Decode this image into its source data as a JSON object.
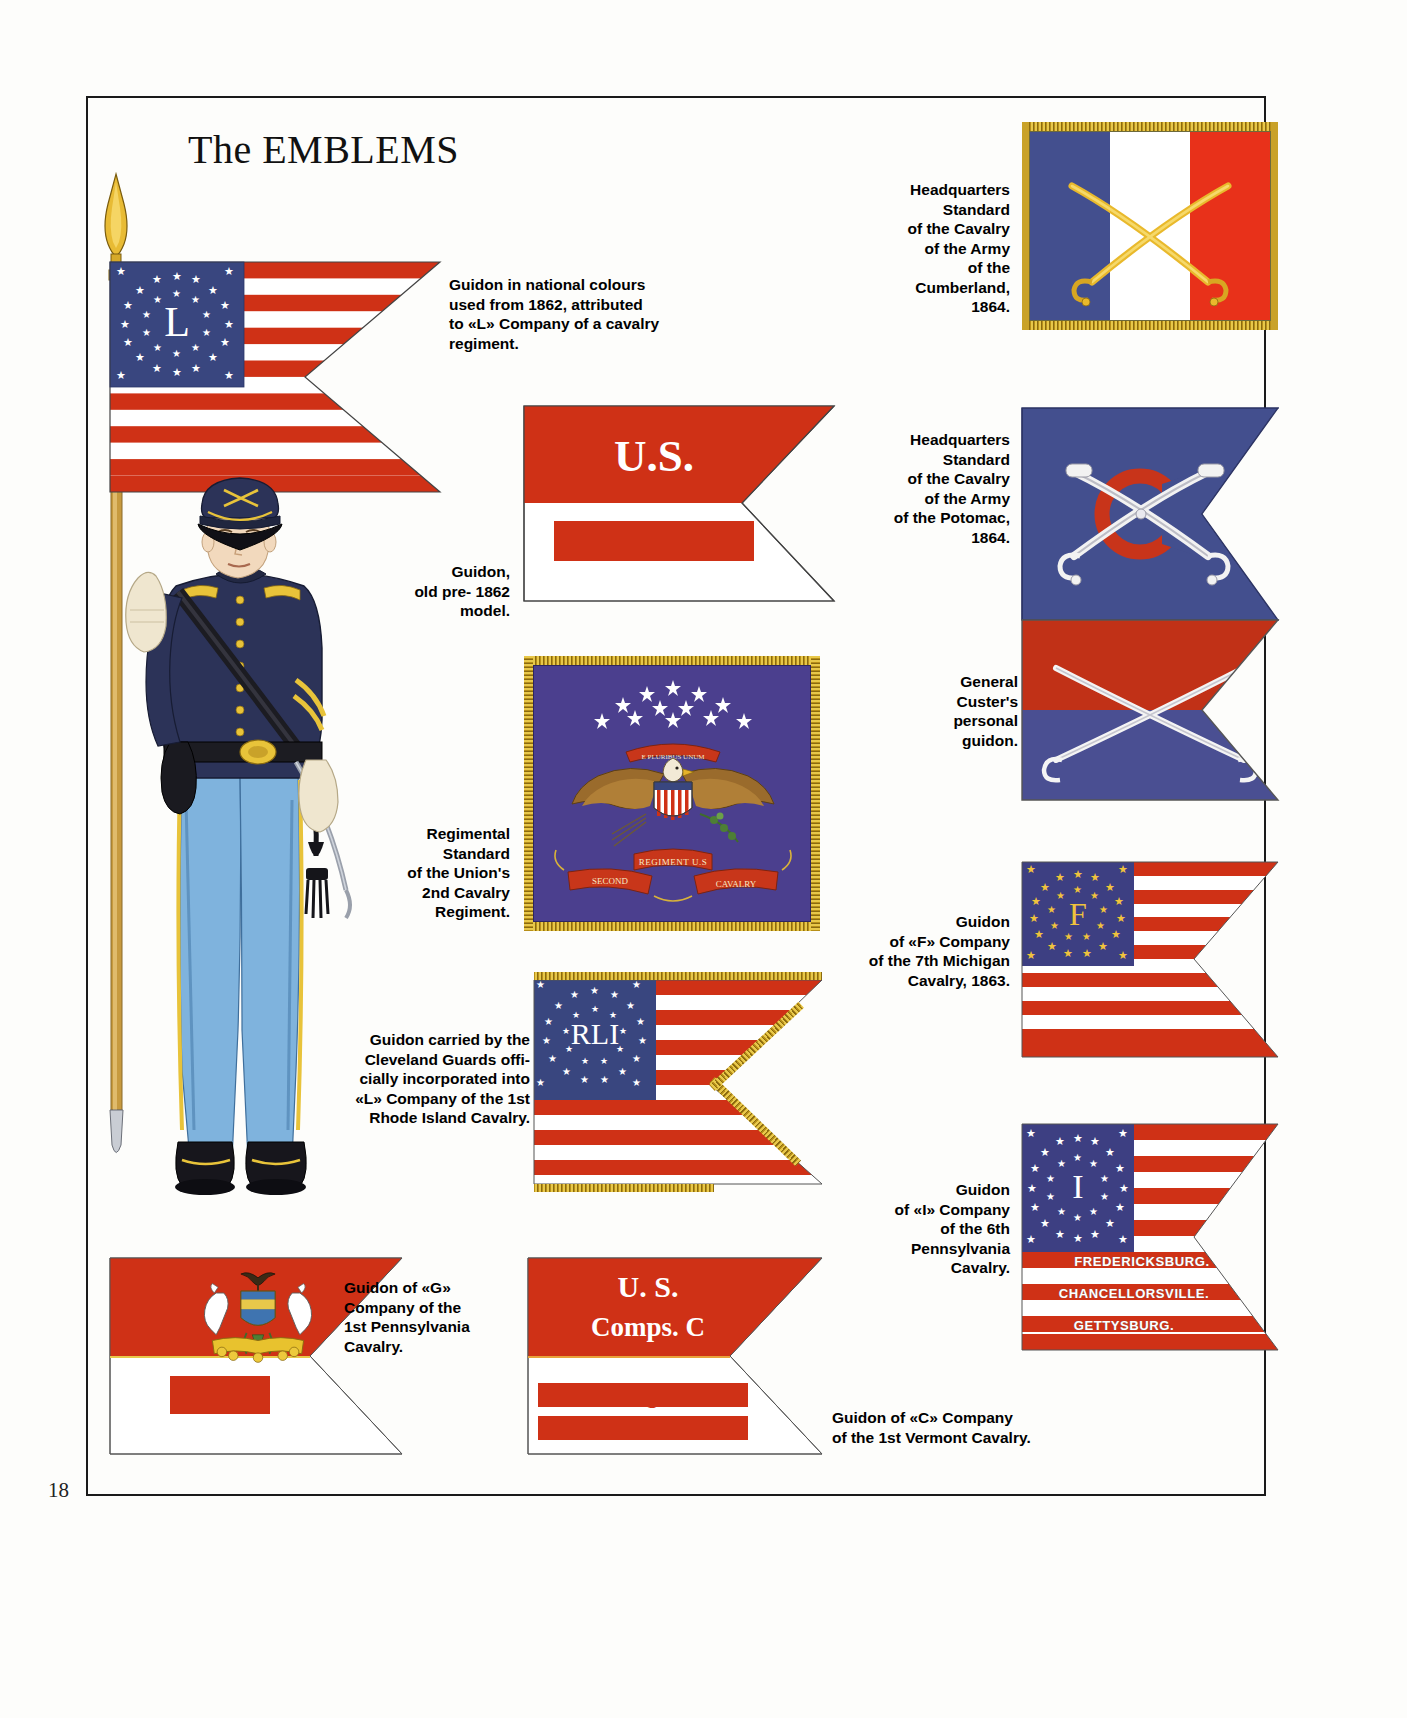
{
  "page": {
    "title": "The EMBLEMS",
    "number": "18"
  },
  "plate": {
    "figure_name": "union-cavalry-officer"
  },
  "captions": {
    "guidon_national_1862": "Guidon in national colours\nused from 1862, attributed\nto «L» Company of a cavalry\nregiment.",
    "guidon_pre1862": "Guidon,\nold pre- 1862 model.",
    "regimental_standard_2nd": "Regimental\nStandard\nof the Union's\n2nd Cavalry\nRegiment.",
    "cleveland_guards": "Guidon carried by the\nCleveland Guards offi-\ncially incorporated into\n«L» Company of the 1st\nRhode Island  Cavalry.",
    "guidon_g_1st_pennsylvania": "Guidon of «G»\nCompany of the\n1st Pennsylvania\nCavalry.",
    "guidon_c_1st_vermont": "Guidon of «C» Company\nof the 1st Vermont Cavalry.",
    "hq_cumberland": "Headquarters\nStandard\nof the Cavalry\nof the Army\nof the Cumberland,\n1864.",
    "hq_potomac": "Headquarters\nStandard\nof the Cavalry\nof the Army\nof the Potomac,\n1864.",
    "custer_guidon": "General\nCuster's\npersonal\nguidon.",
    "guidon_f_7th_michigan": "Guidon\nof «F» Company\nof the 7th Michigan\nCavalry, 1863.",
    "guidon_i_6th_pennsylvania": "Guidon\nof «I» Company\nof the 6th\nPennsylvania\nCavalry."
  },
  "flags": {
    "national_guidon_L": {
      "company_letter": "L",
      "star_count": 34
    },
    "pre1862_guidon": {
      "line1": "U.S.",
      "line2": "F"
    },
    "regimental_standard": {
      "scroll_center": "REGIMENT U.S",
      "scroll_left": "SECOND",
      "scroll_right": "CAVALRY",
      "motto": "E PLURIBUS UNUM"
    },
    "rhode_island_guidon": {
      "company_letters": "RLI"
    },
    "pennsylvania_G_guidon": {
      "label": "G."
    },
    "vermont_C_guidon": {
      "line1": "U. S.",
      "line2": "Comps.   C",
      "line3": "1st.  Regt. Vt.",
      "line4": "CAVALRY"
    },
    "michigan_F_guidon": {
      "company_letter": "F"
    },
    "pennsylvania_I_guidon": {
      "company_letter": "I",
      "battle_honours": [
        "FREDERICKSBURG.",
        "CHANCELLORSVILLE.",
        "GETTYSBURG."
      ]
    }
  },
  "colors": {
    "flag_red": "#cf3116",
    "flag_blue": "#39467f",
    "canton_blue": "#3d3f82",
    "fringe_gold": "#e8c84a",
    "standard_purple": "#4b3f8e",
    "uniform_blue": "#2c3358",
    "trouser_blue": "#7fb3dd",
    "custer_red": "#c13117",
    "custer_blue": "#4a4f92"
  }
}
